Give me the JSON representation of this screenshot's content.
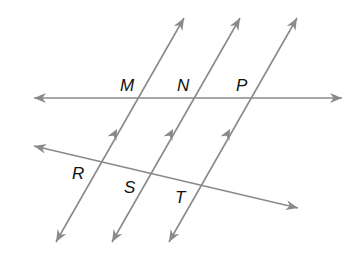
{
  "figure": {
    "labels": {
      "M": "M",
      "N": "N",
      "P": "P",
      "R": "R",
      "S": "S",
      "T": "T"
    },
    "colors": {
      "line": "#8a8a8a",
      "label": "#111111",
      "background": "#ffffff"
    },
    "parallel_marks": "single arrowhead on each of the three parallel lines",
    "lines": [
      {
        "name": "line-MNP",
        "kind": "transversal",
        "through": [
          "M",
          "N",
          "P"
        ],
        "ends": "arrows both ends"
      },
      {
        "name": "line-RST",
        "kind": "transversal",
        "through": [
          "R",
          "S",
          "T"
        ],
        "ends": "arrows both ends"
      },
      {
        "name": "line-MR",
        "kind": "parallel",
        "through": [
          "M",
          "R"
        ],
        "ends": "arrows both ends"
      },
      {
        "name": "line-NS",
        "kind": "parallel",
        "through": [
          "N",
          "S"
        ],
        "ends": "arrows both ends"
      },
      {
        "name": "line-PT",
        "kind": "parallel",
        "through": [
          "P",
          "T"
        ],
        "ends": "arrows both ends"
      }
    ]
  }
}
